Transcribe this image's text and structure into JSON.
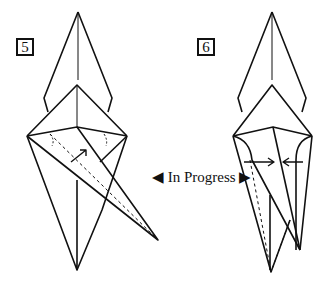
{
  "diagram": {
    "type": "origami-folding-diagram",
    "steps": [
      {
        "number": "5",
        "description": "flap being folded up (arrow indicates fold direction)"
      },
      {
        "number": "6",
        "description": "sides folded toward center (opposing arrows)"
      }
    ],
    "transition_label": "In Progress",
    "colors": {
      "line": "#111111",
      "background": "#ffffff"
    }
  }
}
